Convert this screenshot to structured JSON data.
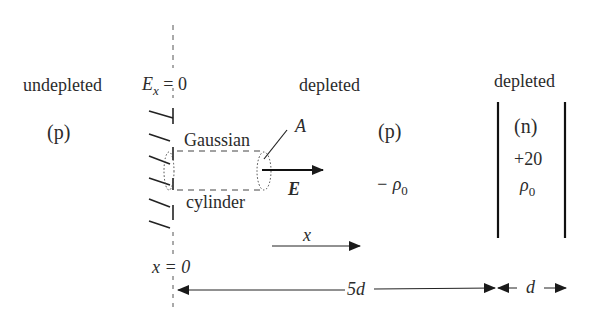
{
  "diagram": {
    "type": "pn-junction-gaussian-cylinder",
    "labels": {
      "left_region": "undepleted",
      "left_type": "(p)",
      "boundary_field": "E",
      "boundary_field_sub": "x",
      "boundary_field_value": " = 0",
      "gaussian_top": "Gaussian",
      "gaussian_bottom": "cylinder",
      "area_label": "A",
      "field_label": "E",
      "mid_region": "depleted",
      "mid_type": "(p)",
      "mid_charge": "− ρ",
      "mid_charge_sub": "0",
      "right_region": "depleted",
      "right_type": "(n)",
      "right_charge_coef": "+20",
      "right_charge": "ρ",
      "right_charge_sub": "0",
      "x_axis_label": "x",
      "origin_label": "x = 0",
      "width_p": "5d",
      "width_n": "d"
    },
    "colors": {
      "ink": "#2b2b2b",
      "background": "#ffffff"
    }
  }
}
